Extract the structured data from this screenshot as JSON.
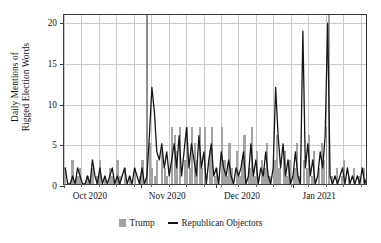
{
  "chart_data": {
    "type": "bar",
    "title": "",
    "xlabel": "",
    "ylabel": "Daily Mentions of Rigged Election Words",
    "ylabel_line1": "Daily Mentions of",
    "ylabel_line2": "Rigged Election Words",
    "ylim": [
      0,
      21
    ],
    "yticks": [
      0,
      5,
      10,
      15,
      20
    ],
    "ytick_labels": [
      "0",
      "5",
      "10",
      "15",
      "20"
    ],
    "xtick_labels": [
      "Oct 2020",
      "Nov 2020",
      "Dec 2020",
      "Jan 2021"
    ],
    "xtick_positions": [
      0,
      31,
      61,
      92
    ],
    "x_start_label": "Oct 2020",
    "x_end_label": "Jan 2021",
    "x_days_total": 122,
    "grid": true,
    "legend_position": "bottom",
    "legend": [
      {
        "label": "Trump",
        "marker": "bar",
        "color": "#a3a3a3"
      },
      {
        "label": "Republican Objectors",
        "marker": "line",
        "color": "#161616"
      }
    ],
    "series": [
      {
        "name": "Trump",
        "type": "bar",
        "color": "#a3a3a3",
        "values": [
          2,
          0,
          0,
          3,
          0,
          1,
          2,
          0,
          0,
          1,
          0,
          2,
          0,
          1,
          3,
          0,
          1,
          0,
          2,
          1,
          0,
          3,
          1,
          0,
          2,
          0,
          1,
          0,
          2,
          0,
          1,
          3,
          0,
          21,
          5,
          2,
          1,
          3,
          0,
          4,
          2,
          1,
          0,
          7,
          6,
          4,
          7,
          0,
          3,
          7,
          2,
          7,
          5,
          3,
          7,
          2,
          7,
          0,
          4,
          7,
          1,
          2,
          0,
          7,
          3,
          1,
          5,
          2,
          0,
          4,
          1,
          3,
          6,
          0,
          2,
          7,
          1,
          4,
          0,
          3,
          2,
          5,
          1,
          0,
          3,
          6,
          2,
          0,
          4,
          1,
          3,
          0,
          2,
          5,
          1,
          0,
          3,
          2,
          6,
          1,
          4,
          0,
          2,
          5,
          3,
          7,
          21,
          1,
          0,
          2,
          0,
          1,
          3,
          0,
          1,
          0,
          2,
          0,
          1,
          0,
          2,
          0,
          1
        ]
      },
      {
        "name": "Republican Objectors",
        "type": "line",
        "color": "#161616",
        "values": [
          2,
          0,
          0,
          1,
          0,
          2,
          1,
          0,
          0,
          1,
          0,
          3,
          1,
          0,
          2,
          0,
          1,
          0,
          1,
          2,
          0,
          1,
          0,
          1,
          2,
          0,
          1,
          0,
          2,
          1,
          0,
          2,
          0,
          1,
          6,
          12,
          9,
          4,
          3,
          5,
          2,
          4,
          1,
          3,
          5,
          2,
          6,
          1,
          4,
          7,
          2,
          5,
          3,
          1,
          6,
          2,
          4,
          0,
          3,
          5,
          1,
          2,
          0,
          4,
          2,
          1,
          3,
          1,
          0,
          2,
          1,
          2,
          4,
          0,
          1,
          5,
          1,
          3,
          0,
          2,
          1,
          4,
          1,
          0,
          2,
          12,
          6,
          2,
          5,
          1,
          3,
          0,
          1,
          4,
          1,
          0,
          19,
          2,
          5,
          1,
          3,
          0,
          1,
          4,
          2,
          6,
          20,
          1,
          0,
          1,
          0,
          1,
          2,
          0,
          2,
          0,
          1,
          0,
          1,
          0,
          2,
          0,
          1
        ]
      }
    ],
    "annotations": [
      {
        "label": "election-day-marker",
        "x_day": 33,
        "style": "vertical-bar"
      },
      {
        "label": "jan-6-marker",
        "x_day": 105,
        "style": "vertical-bar"
      }
    ]
  }
}
